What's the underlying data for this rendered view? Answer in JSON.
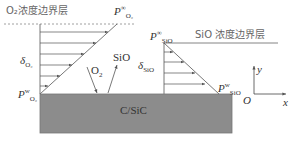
{
  "diagram": {
    "o2_boundary_layer_label": "O₂浓度边界层",
    "sio_boundary_layer_label": "SiO 浓度边界层",
    "substrate_label": "C/SiC",
    "o2_flux_label": "O",
    "o2_flux_sub": "2",
    "sio_flux_label": "SiO",
    "o2_thickness": {
      "sym": "δ",
      "sub": "O₂"
    },
    "sio_thickness": {
      "sym": "δ",
      "sub": "SiO"
    },
    "p_o2_inf": {
      "sym": "P",
      "sup": "∞",
      "sub": "O₂"
    },
    "p_o2_wall": {
      "sym": "P",
      "sup": "w",
      "sub": "O₂"
    },
    "p_sio_inf": {
      "sym": "P",
      "sup": "∞",
      "sub": "SiO"
    },
    "p_sio_wall": {
      "sym": "P",
      "sup": "w",
      "sub": "SiO"
    },
    "axes": {
      "origin": "O",
      "x": "x",
      "y": "y"
    },
    "colors": {
      "substrate": "#8c8c8c",
      "line": "#555555",
      "dashed": "#888888"
    }
  }
}
